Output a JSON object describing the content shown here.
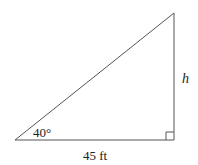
{
  "diagram": {
    "type": "right-triangle",
    "angle_label": "40°",
    "base_label": "45 ft",
    "height_label": "h",
    "colors": {
      "stroke": "#555555",
      "text": "#222222",
      "background": "#ffffff"
    }
  }
}
